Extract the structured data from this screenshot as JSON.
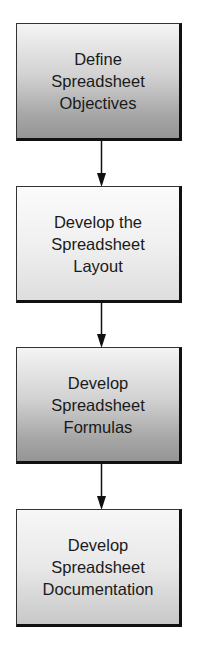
{
  "flowchart": {
    "direction": "top-to-bottom",
    "steps": [
      {
        "label": "Define\nSpreadsheet\nObjectives",
        "shading": "dark"
      },
      {
        "label": "Develop the\nSpreadsheet\nLayout",
        "shading": "light"
      },
      {
        "label": "Develop\nSpreadsheet\nFormulas",
        "shading": "dark"
      },
      {
        "label": "Develop\nSpreadsheet\nDocumentation",
        "shading": "light"
      }
    ],
    "connectors": [
      {
        "from": 0,
        "to": 1,
        "icon": "arrow-down-icon"
      },
      {
        "from": 1,
        "to": 2,
        "icon": "arrow-down-icon"
      },
      {
        "from": 2,
        "to": 3,
        "icon": "arrow-down-icon"
      }
    ],
    "colors": {
      "border": "#111111",
      "arrow": "#111111",
      "text": "#1a1a1a",
      "background": "#ffffff"
    }
  }
}
